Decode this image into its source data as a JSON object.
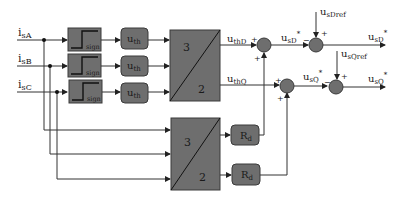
{
  "diagram": {
    "inputs": [
      {
        "main": "i",
        "sub": "sA"
      },
      {
        "main": "i",
        "sub": "sB"
      },
      {
        "main": "i",
        "sub": "sC"
      }
    ],
    "sign_blocks": [
      {
        "label": "sign"
      },
      {
        "label": "sign"
      },
      {
        "label": "sign"
      }
    ],
    "threshold_blocks": [
      {
        "main": "u",
        "sub": "th"
      },
      {
        "main": "u",
        "sub": "th"
      },
      {
        "main": "u",
        "sub": "th"
      }
    ],
    "transform_upper": {
      "top": "3",
      "bottom": "2"
    },
    "transform_lower": {
      "top": "3",
      "bottom": "2"
    },
    "resistor_blocks": [
      {
        "main": "R",
        "sub": "d"
      },
      {
        "main": "R",
        "sub": "d"
      }
    ],
    "signals": {
      "uthD": {
        "main": "u",
        "sub": "thD"
      },
      "uthQ": {
        "main": "u",
        "sub": "thQ"
      },
      "usD_star_mid": {
        "main": "u",
        "sub": "sD",
        "sup": "*"
      },
      "usQ_star_mid": {
        "main": "u",
        "sub": "sQ",
        "sup": "*"
      },
      "usDref": {
        "main": "u",
        "sub": "sDref"
      },
      "usQref": {
        "main": "u",
        "sub": "sQref"
      },
      "usD_star_out": {
        "main": "u",
        "sub": "sD",
        "sup": "*"
      },
      "usQ_star_out": {
        "main": "u",
        "sub": "sQ",
        "sup": "*"
      }
    },
    "signs": {
      "plus": "+",
      "minus": "−"
    },
    "colors": {
      "block_fill": "#6e6e6e",
      "block_stroke": "#3a3a3a",
      "line": "#333333",
      "text": "#1a1a1a"
    }
  }
}
